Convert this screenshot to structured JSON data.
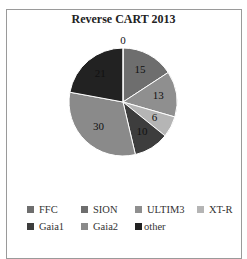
{
  "chart_data": {
    "type": "pie",
    "title": "Reverse CART 2013",
    "categories": [
      "FFC",
      "SION",
      "ULTIM3",
      "XT-R",
      "Gaia1",
      "Gaia2",
      "other"
    ],
    "values": [
      0,
      15,
      13,
      6,
      10,
      30,
      21
    ],
    "colors": [
      "#6e6e6e",
      "#6e6e6e",
      "#8f8f8f",
      "#b5b5b5",
      "#3d3d3d",
      "#8a8a8a",
      "#222222"
    ],
    "data_labels": [
      "0",
      "15",
      "13",
      "6",
      "10",
      "30",
      "21"
    ],
    "legend_position": "bottom",
    "start_angle": "12 o'clock, clockwise"
  },
  "legend": {
    "rows": [
      [
        {
          "label": "FFC",
          "color": "#6e6e6e"
        },
        {
          "label": "SION",
          "color": "#6e6e6e"
        },
        {
          "label": "ULTIM3",
          "color": "#8f8f8f"
        },
        {
          "label": "XT-R",
          "color": "#b5b5b5"
        }
      ],
      [
        {
          "label": "Gaia1",
          "color": "#3d3d3d"
        },
        {
          "label": "Gaia2",
          "color": "#8a8a8a"
        },
        {
          "label": "other",
          "color": "#222222"
        }
      ]
    ]
  }
}
